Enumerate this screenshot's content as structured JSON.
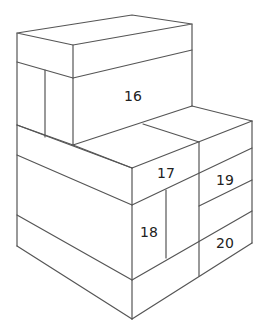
{
  "diagram": {
    "type": "isometric-stacked-boxes",
    "stroke_color": "#555555",
    "labels": [
      {
        "id": "16",
        "text": "16",
        "x": 133,
        "y": 96
      },
      {
        "id": "17",
        "text": "17",
        "x": 166,
        "y": 173
      },
      {
        "id": "18",
        "text": "18",
        "x": 149,
        "y": 232
      },
      {
        "id": "19",
        "text": "19",
        "x": 225,
        "y": 180
      },
      {
        "id": "20",
        "text": "20",
        "x": 225,
        "y": 243
      }
    ]
  }
}
